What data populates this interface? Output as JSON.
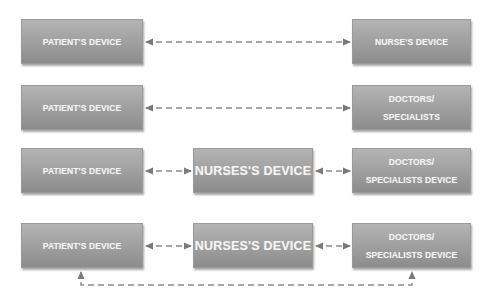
{
  "diagram": {
    "rows": [
      {
        "left": {
          "label": "PATIENT'S DEVICE"
        },
        "right": {
          "lines": [
            "NURSE'S DEVICE"
          ]
        }
      },
      {
        "left": {
          "label": "PATIENT'S DEVICE"
        },
        "right": {
          "lines": [
            "DOCTORS/",
            "SPECIALISTS"
          ]
        }
      },
      {
        "left": {
          "label": "PATIENT'S DEVICE"
        },
        "middle": {
          "label": "NURSES'S DEVICE"
        },
        "right": {
          "lines": [
            "DOCTORS/",
            "SPECIALISTS DEVICE"
          ]
        }
      },
      {
        "left": {
          "label": "PATIENT'S DEVICE"
        },
        "middle": {
          "label": "NURSES'S DEVICE"
        },
        "right": {
          "lines": [
            "DOCTORS/",
            "SPECIALISTS DEVICE"
          ]
        }
      }
    ],
    "connectors": [
      {
        "from": "row1.patient",
        "to": "row1.nurse",
        "style": "dashed",
        "arrows": "both"
      },
      {
        "from": "row2.patient",
        "to": "row2.doctors",
        "style": "dashed",
        "arrows": "both"
      },
      {
        "from": "row3.patient",
        "to": "row3.nurse",
        "style": "dashed",
        "arrows": "both"
      },
      {
        "from": "row3.nurse",
        "to": "row3.doctors",
        "style": "dashed",
        "arrows": "both"
      },
      {
        "from": "row4.patient",
        "to": "row4.nurse",
        "style": "dashed",
        "arrows": "both"
      },
      {
        "from": "row4.nurse",
        "to": "row4.doctors",
        "style": "dashed",
        "arrows": "both"
      },
      {
        "from": "row4.patient",
        "to": "row4.doctors",
        "style": "dashed",
        "arrows": "both",
        "route": "below"
      }
    ],
    "colors": {
      "box_top": "#b4b4b4",
      "box_bottom": "#8c8c8c",
      "text": "#f4f4f4",
      "connector": "#7a7a7a"
    }
  }
}
